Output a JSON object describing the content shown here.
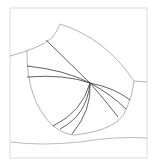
{
  "diagram": {
    "type": "pattern-line-drawing",
    "colors": {
      "background": "#ffffff",
      "frame": "#d8d8d8",
      "outline": "#9a9a9a",
      "radial_lines": "#3a3a3a"
    },
    "apex": {
      "x": 90,
      "y": 83
    },
    "radial_line_count": 9
  }
}
